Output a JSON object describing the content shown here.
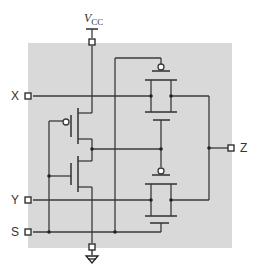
{
  "diagram": {
    "supply_label": "V",
    "supply_subscript": "CC",
    "inputs": [
      {
        "label": "X"
      },
      {
        "label": "Y"
      },
      {
        "label": "S"
      }
    ],
    "output": {
      "label": "Z"
    },
    "ground": "ground-symbol",
    "colors": {
      "background": "#d9d9d9",
      "wire": "#3a3a3a",
      "page": "#ffffff"
    },
    "components": [
      {
        "type": "inverter",
        "devices": [
          "pmos",
          "nmos"
        ],
        "input": "S"
      },
      {
        "type": "transmission-gate",
        "signal": "X",
        "to": "Z"
      },
      {
        "type": "transmission-gate",
        "signal": "Y",
        "to": "Z"
      }
    ]
  }
}
